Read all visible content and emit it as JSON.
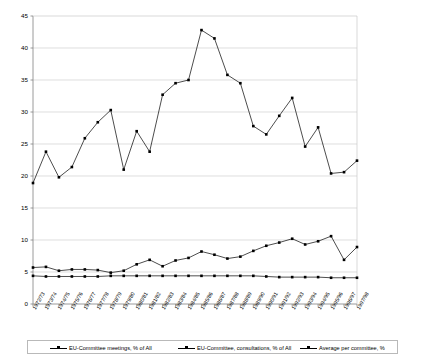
{
  "chart_data": {
    "type": "line",
    "title": "",
    "subtitle": "",
    "xlabel": "",
    "ylabel": "",
    "ylim": [
      0,
      45
    ],
    "ytick_step": 5,
    "yticks": [
      "0",
      "5",
      "10",
      "15",
      "20",
      "25",
      "30",
      "35",
      "40",
      "45"
    ],
    "grid": true,
    "legend_position": "bottom",
    "categories": [
      "1972/73",
      "1973/74",
      "1974/75",
      "1975/76",
      "1976/77",
      "1977/78",
      "1978/79",
      "1979/80",
      "1980/81",
      "1981/82",
      "1982/83",
      "1983/84",
      "1984/85",
      "1985/86",
      "1986/87",
      "1987/88",
      "1988/89",
      "1989/90",
      "1990/91",
      "1991/92",
      "1992/93",
      "1993/94",
      "1994/95",
      "1995/96",
      "1996/97",
      "1997/98"
    ],
    "series": [
      {
        "name": "EU-Committee meetings, % of All",
        "marker": "square",
        "color": "#000000",
        "values": [
          18.9,
          23.8,
          19.8,
          21.4,
          25.9,
          28.4,
          30.3,
          21.0,
          27.0,
          23.8,
          32.7,
          34.5,
          35.0,
          42.8,
          41.5,
          35.8,
          34.5,
          27.8,
          26.5,
          29.4,
          32.2,
          24.6,
          27.6,
          20.4,
          20.6,
          22.4
        ]
      },
      {
        "name": "EU-Committee, consultations, % of All",
        "marker": "square",
        "color": "#000000",
        "values": [
          5.7,
          5.8,
          5.2,
          5.4,
          5.4,
          5.3,
          4.9,
          5.2,
          6.2,
          6.9,
          5.9,
          6.8,
          7.2,
          8.2,
          7.7,
          7.1,
          7.4,
          8.3,
          9.1,
          9.6,
          10.2,
          9.3,
          9.8,
          10.6,
          6.9,
          8.9
        ]
      },
      {
        "name": "Average per committee, %",
        "marker": "square",
        "color": "#000000",
        "values": [
          4.4,
          4.3,
          4.3,
          4.3,
          4.3,
          4.3,
          4.4,
          4.4,
          4.4,
          4.4,
          4.4,
          4.4,
          4.4,
          4.4,
          4.4,
          4.4,
          4.4,
          4.4,
          4.3,
          4.2,
          4.2,
          4.2,
          4.2,
          4.1,
          4.1,
          4.1
        ]
      }
    ]
  },
  "legend": {
    "items": [
      {
        "label": "EU-Committee meetings, % of All"
      },
      {
        "label": "EU-Committee, consultations, % of All"
      },
      {
        "label": "Average per committee, %"
      }
    ]
  },
  "axes": {
    "y_max_label": "45",
    "y_min_label": "0"
  }
}
